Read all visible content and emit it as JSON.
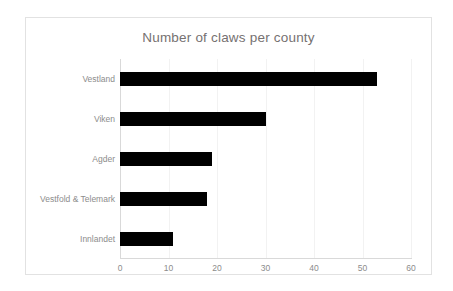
{
  "chart_data": {
    "type": "bar",
    "orientation": "horizontal",
    "title": "Number of claws per county",
    "xlabel": "",
    "ylabel": "",
    "categories": [
      "Vestland",
      "Viken",
      "Agder",
      "Vestfold & Telemark",
      "Innlandet"
    ],
    "values": [
      53,
      30,
      19,
      18,
      11
    ],
    "xlim": [
      0,
      60
    ],
    "xticks": [
      0,
      10,
      20,
      30,
      40,
      50,
      60
    ],
    "xtick_labels": [
      "0",
      "10",
      "20",
      "30",
      "40",
      "50",
      "60"
    ],
    "grid": "vertical-only",
    "legend": "none",
    "series": [
      {
        "name": "Number of claws",
        "values": [
          53,
          30,
          19,
          18,
          11
        ]
      }
    ],
    "bar_color": "#000000",
    "grid_color": "#f2f2f2",
    "axis_color": "#d9d9d9",
    "text_color": "#8c8c8c",
    "title_color": "#767171",
    "plot_background": "#ffffff",
    "frame_border_color": "#e2e2e2"
  }
}
